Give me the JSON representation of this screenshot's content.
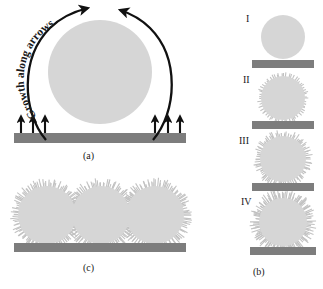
{
  "figure": {
    "caption_labels": {
      "a": "(a)",
      "b": "(b)",
      "c": "(c)"
    },
    "annotation": {
      "growth_text": "Growth along arrows"
    },
    "stage_labels": {
      "one": "I",
      "two": "II",
      "three": "III",
      "four": "IV"
    },
    "colors": {
      "sphere_fill": "#d6d6d6",
      "sphere_fuzz": "#c4c4c4",
      "substrate": "#7d7d7d",
      "arrow": "#111111",
      "background": "#ffffff",
      "text": "#1a1a1a"
    },
    "panel_a": {
      "sphere": {
        "cx": 100,
        "cy": 72,
        "r": 52
      },
      "substrate": {
        "x": 14,
        "y": 133,
        "width": 172,
        "height": 10
      },
      "growth_arrow_count": 6,
      "curved_arrow_count": 2
    },
    "panel_b": {
      "stages": [
        {
          "label": "I",
          "cx": 283,
          "cy": 37,
          "r": 22,
          "fuzz_density": 0,
          "fuzz_length": 0,
          "bar_y": 60,
          "bar_x": 252,
          "bar_w": 62
        },
        {
          "label": "II",
          "cx": 283,
          "cy": 98,
          "r": 22,
          "fuzz_density": 60,
          "fuzz_length": 3,
          "bar_y": 121,
          "bar_x": 252,
          "bar_w": 62
        },
        {
          "label": "III",
          "cx": 283,
          "cy": 159,
          "r": 23,
          "fuzz_density": 95,
          "fuzz_length": 5,
          "bar_y": 183,
          "bar_x": 252,
          "bar_w": 62
        },
        {
          "label": "IV",
          "cx": 283,
          "cy": 222,
          "r": 24,
          "fuzz_density": 130,
          "fuzz_length": 7,
          "bar_y": 247,
          "bar_x": 250,
          "bar_w": 66
        }
      ]
    },
    "panel_c": {
      "spheres": [
        {
          "cx": 47,
          "cy": 215,
          "r": 29
        },
        {
          "cx": 101,
          "cy": 215,
          "r": 29
        },
        {
          "cx": 155,
          "cy": 215,
          "r": 29
        }
      ],
      "fuzz_density": 120,
      "fuzz_length": 6,
      "substrate": {
        "x": 14,
        "y": 243,
        "width": 172,
        "height": 9
      }
    }
  }
}
